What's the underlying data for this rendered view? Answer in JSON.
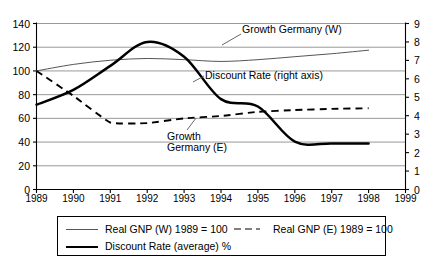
{
  "chart_data": {
    "type": "line",
    "title": "",
    "xlabel": "",
    "ylabel": "",
    "y2label": "",
    "grid": true,
    "legend_position": "bottom",
    "x": [
      1989,
      1990,
      1991,
      1992,
      1993,
      1994,
      1995,
      1996,
      1997,
      1998,
      1999
    ],
    "xtick_labels": [
      "1989",
      "1990",
      "1991",
      "1992",
      "1993",
      "1994",
      "1995",
      "1996",
      "1997",
      "1998",
      "1999"
    ],
    "ylim": [
      0,
      140
    ],
    "ytick_labels": [
      "0",
      "20",
      "40",
      "60",
      "80",
      "100",
      "120",
      "140"
    ],
    "ytick_values": [
      0,
      20,
      40,
      60,
      80,
      100,
      120,
      140
    ],
    "y2lim": [
      0,
      9
    ],
    "y2tick_labels": [
      "0",
      "1",
      "2",
      "3",
      "4",
      "5",
      "6",
      "7",
      "8",
      "9"
    ],
    "y2tick_values": [
      0,
      1,
      2,
      3,
      4,
      5,
      6,
      7,
      8,
      9
    ],
    "series": [
      {
        "name": "Real GNP (W) 1989 = 100",
        "axis": "left",
        "style": "thin-solid",
        "color": "#555555",
        "x": [
          1989,
          1990,
          1991,
          1992,
          1993,
          1994,
          1995,
          1996,
          1997,
          1998
        ],
        "values": [
          100,
          105.5,
          109,
          110.5,
          109.5,
          108,
          109.5,
          112,
          114.5,
          117.5
        ]
      },
      {
        "name": "Real GNP (E) 1989 = 100",
        "axis": "left",
        "style": "dashed",
        "color": "#000000",
        "x": [
          1989,
          1990,
          1991,
          1992,
          1993,
          1994,
          1995,
          1996,
          1997,
          1998
        ],
        "values": [
          100,
          79,
          56.5,
          56,
          60,
          62,
          65.5,
          67,
          68,
          68.5
        ]
      },
      {
        "name": "Discount Rate (average) %",
        "axis": "right",
        "style": "thick-solid",
        "color": "#000000",
        "x": [
          1989,
          1990,
          1991,
          1992,
          1993,
          1994,
          1995,
          1996,
          1997,
          1998
        ],
        "values": [
          4.6,
          5.4,
          6.7,
          8.0,
          7.2,
          4.9,
          4.5,
          2.6,
          2.5,
          2.5
        ]
      }
    ],
    "annotations": [
      {
        "text": "Growth Germany (W)",
        "target_series": "Real GNP (W) 1989 = 100"
      },
      {
        "text": "Discount Rate (right axis)",
        "target_series": "Discount Rate (average) %"
      },
      {
        "text": "Growth",
        "target_series": "Real GNP (E) 1989 = 100"
      },
      {
        "text": "Germany (E)",
        "target_series": "Real GNP (E) 1989 = 100"
      }
    ]
  },
  "axes": {
    "left_ticks": [
      "140",
      "120",
      "100",
      "80",
      "60",
      "40",
      "20",
      "0"
    ],
    "right_ticks": [
      "9",
      "8",
      "7",
      "6",
      "5",
      "4",
      "3",
      "2",
      "1",
      "0"
    ],
    "x_ticks": [
      "1989",
      "1990",
      "1991",
      "1992",
      "1993",
      "1994",
      "1995",
      "1996",
      "1997",
      "1998",
      "1999"
    ]
  },
  "annotations": {
    "growth_west": "Growth Germany (W)",
    "discount_rate": "Discount Rate (right axis)",
    "growth_east_line1": "Growth",
    "growth_east_line2": "Germany (E)"
  },
  "legend": {
    "item_gnp_w": "Real GNP (W) 1989 = 100",
    "item_gnp_e": "Real GNP (E) 1989 = 100",
    "item_discount": "Discount Rate (average) %"
  },
  "colors": {
    "gridline": "#8d8d8d",
    "axis": "#000000",
    "thin_series": "#555555",
    "thick_series": "#000000"
  }
}
